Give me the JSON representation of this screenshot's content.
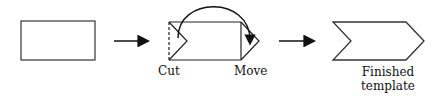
{
  "diagram": {
    "title": "",
    "steps": [
      {
        "id": "rectangle",
        "label": ""
      },
      {
        "id": "cut-move",
        "labels": {
          "cut": "Cut",
          "move": "Move"
        }
      },
      {
        "id": "finished",
        "label_line1": "Finished",
        "label_line2": "template"
      }
    ],
    "colors": {
      "stroke": "#333333",
      "arrow": "#111111",
      "background": "#ffffff"
    }
  }
}
